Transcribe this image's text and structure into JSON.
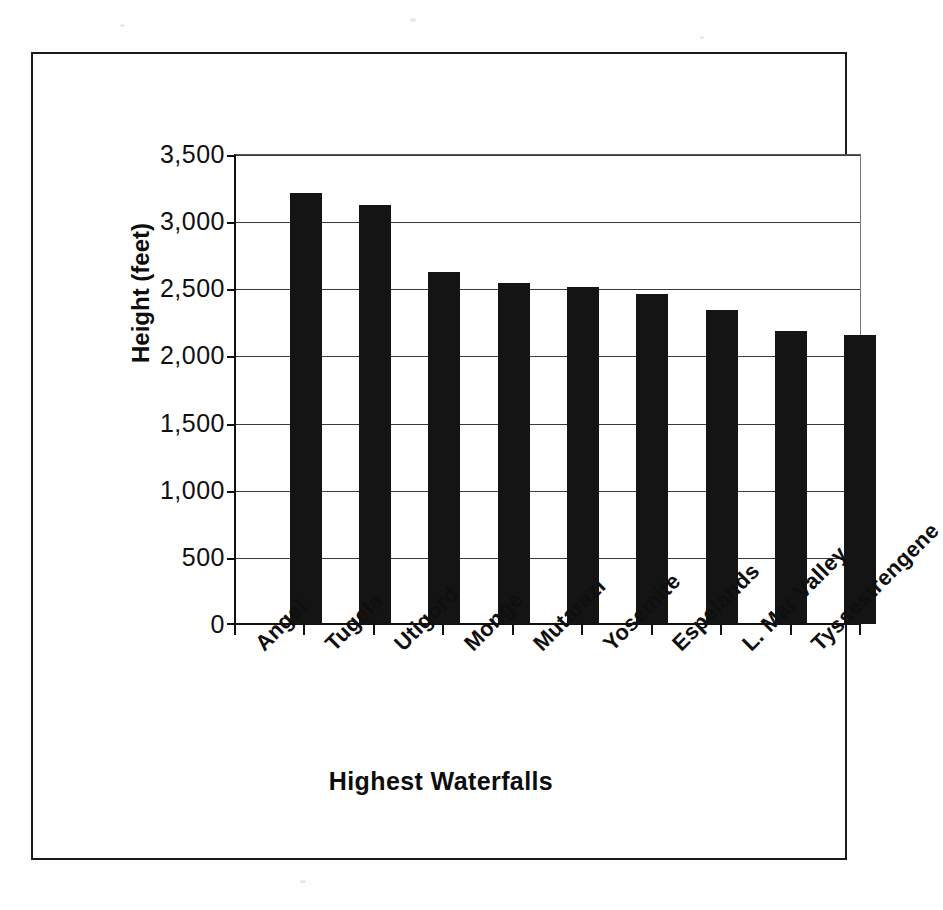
{
  "chart_data": {
    "type": "bar",
    "title": "",
    "subtitle": "",
    "xlabel": "Highest Waterfalls",
    "ylabel": "Height (feet)",
    "categories": [
      "Angel",
      "Tugela",
      "Utigord",
      "Monge",
      "Mutarazi",
      "Yosemite",
      "Espelands",
      "L. Mar Valley",
      "Tyssestrengene"
    ],
    "values": [
      3230,
      3140,
      2640,
      2555,
      2525,
      2470,
      2355,
      2195,
      2165
    ],
    "ylim": [
      0,
      3500
    ],
    "ytick_values": [
      0,
      500,
      1000,
      1500,
      2000,
      2500,
      3000,
      3500
    ],
    "ytick_labels": [
      "0",
      "500",
      "1,000",
      "1,500",
      "2,000",
      "2,500",
      "3,000",
      "3,500"
    ],
    "grid": "horizontal",
    "legend": "none",
    "bar_color": "#141414",
    "axis_color": "#111111",
    "background_color": "#ffffff",
    "xtick_label_rotation": -45,
    "series": [
      {
        "name": "Height (feet)",
        "values": [
          3230,
          3140,
          2640,
          2555,
          2525,
          2470,
          2355,
          2195,
          2165
        ]
      }
    ]
  }
}
